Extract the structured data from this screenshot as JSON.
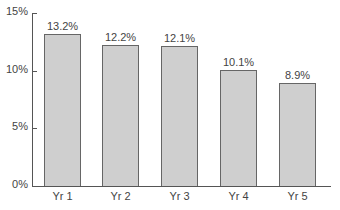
{
  "chart_data": {
    "type": "bar",
    "title": "",
    "xlabel": "",
    "ylabel": "",
    "categories": [
      "Yr 1",
      "Yr 2",
      "Yr 3",
      "Yr 4",
      "Yr 5"
    ],
    "values": [
      13.2,
      12.2,
      12.1,
      10.1,
      8.9
    ],
    "value_labels": [
      "13.2%",
      "12.2%",
      "12.1%",
      "10.1%",
      "8.9%"
    ],
    "ylim": [
      0,
      15
    ],
    "yticks": [
      0,
      5,
      10,
      15
    ],
    "ytick_labels": [
      "0%",
      "5%",
      "10%",
      "15%"
    ],
    "grid": false,
    "legend": null,
    "bar_color": "#cfcfcf",
    "bar_edge_color": "#666666"
  }
}
